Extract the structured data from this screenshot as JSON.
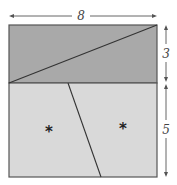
{
  "diagram": {
    "width_label": "8",
    "top_height_label": "3",
    "bottom_height_label": "5",
    "region_marks": [
      "*",
      "*"
    ],
    "colors": {
      "top_fill": "#a9a9a9",
      "bottom_fill": "#d9d9d9",
      "stroke": "#444444",
      "dimension": "#555555"
    }
  }
}
